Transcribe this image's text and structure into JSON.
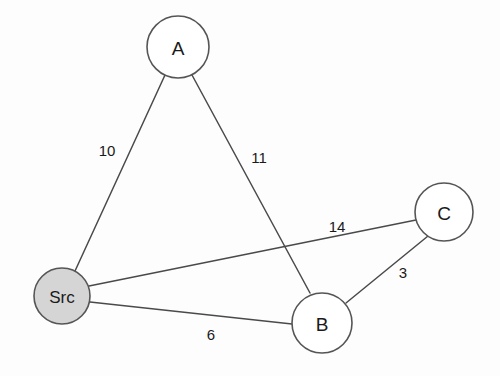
{
  "diagram": {
    "background_color": "#fdfdfd",
    "edge_color": "#4a4a4a",
    "node_stroke_color": "#555555",
    "source_fill_color": "#d5d5d5",
    "node_fill_color": "#ffffff",
    "nodes": [
      {
        "id": "A",
        "label": "A",
        "cx": 178,
        "cy": 47,
        "r": 31,
        "fill": "#ffffff",
        "is_source": false
      },
      {
        "id": "Src",
        "label": "Src",
        "cx": 62,
        "cy": 296,
        "r": 28,
        "fill": "#d5d5d5",
        "is_source": true
      },
      {
        "id": "B",
        "label": "B",
        "cx": 322,
        "cy": 323,
        "r": 30,
        "fill": "#ffffff",
        "is_source": false
      },
      {
        "id": "C",
        "label": "C",
        "cx": 444,
        "cy": 212,
        "r": 29,
        "fill": "#ffffff",
        "is_source": false
      }
    ],
    "edges": [
      {
        "id": "src-a",
        "from": "Src",
        "to": "A",
        "weight": "10",
        "x1": 75,
        "y1": 271,
        "x2": 165,
        "y2": 75,
        "label_x": 107,
        "label_y": 150
      },
      {
        "id": "a-b",
        "from": "A",
        "to": "B",
        "weight": "11",
        "x1": 192,
        "y1": 75,
        "x2": 310,
        "y2": 293,
        "label_x": 259,
        "label_y": 157
      },
      {
        "id": "src-c",
        "from": "Src",
        "to": "C",
        "weight": "14",
        "x1": 89,
        "y1": 286,
        "x2": 416,
        "y2": 220,
        "label_x": 337,
        "label_y": 226
      },
      {
        "id": "src-b",
        "from": "Src",
        "to": "B",
        "weight": "6",
        "x1": 90,
        "y1": 302,
        "x2": 292,
        "y2": 324,
        "label_x": 211,
        "label_y": 334
      },
      {
        "id": "b-c",
        "from": "B",
        "to": "C",
        "weight": "3",
        "x1": 346,
        "y1": 303,
        "x2": 428,
        "y2": 236,
        "label_x": 403,
        "label_y": 272
      }
    ]
  }
}
